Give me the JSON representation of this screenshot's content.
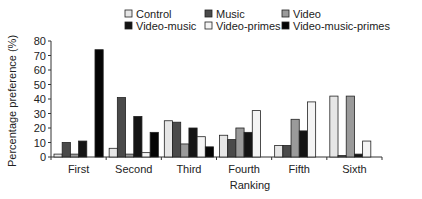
{
  "chart_data": {
    "type": "bar",
    "title": "",
    "xlabel": "Ranking",
    "ylabel": "Percentage preference (%)",
    "ylim": [
      0,
      80
    ],
    "yticks": [
      0,
      10,
      20,
      30,
      40,
      50,
      60,
      70,
      80
    ],
    "grid": false,
    "legend_position": "top",
    "categories": [
      "First",
      "Second",
      "Third",
      "Fourth",
      "Fifth",
      "Sixth"
    ],
    "series": [
      {
        "name": "Control",
        "color": "#e6e6e6",
        "values": [
          2,
          6,
          25,
          15,
          8,
          42
        ]
      },
      {
        "name": "Music",
        "color": "#4a4a4a",
        "values": [
          10,
          41,
          24,
          12,
          8,
          1
        ]
      },
      {
        "name": "Video",
        "color": "#9a9a9a",
        "values": [
          2,
          2,
          9,
          20,
          26,
          42
        ]
      },
      {
        "name": "Video-music",
        "color": "#141414",
        "values": [
          11,
          28,
          20,
          17,
          18,
          2
        ]
      },
      {
        "name": "Video-primes",
        "color": "#f4f4f4",
        "values": [
          0,
          3,
          14,
          32,
          38,
          11
        ]
      },
      {
        "name": "Video-music-primes",
        "color": "#050505",
        "values": [
          74,
          17,
          7,
          0,
          0,
          0
        ]
      }
    ]
  }
}
